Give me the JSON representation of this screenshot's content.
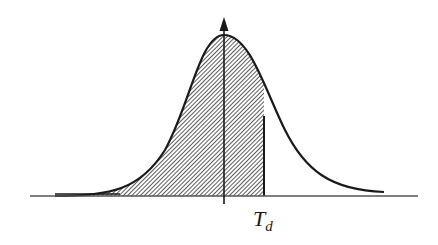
{
  "diagram": {
    "type": "normal-distribution-shaded-area",
    "threshold_label": "T",
    "threshold_subscript": "d",
    "shaded_region": "left of threshold",
    "colors": {
      "stroke": "#1a1a1a",
      "hatch": "#333333",
      "background": "#ffffff"
    }
  }
}
